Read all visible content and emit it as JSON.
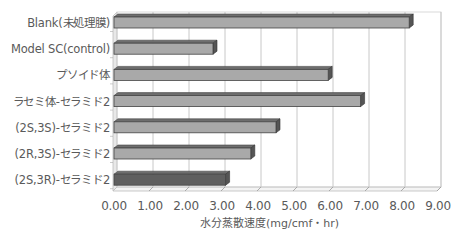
{
  "chart_data": {
    "type": "bar",
    "orientation": "horizontal",
    "style": "3d",
    "title": "",
    "xlabel": "水分蒸散速度(mg/cmf・hr)",
    "ylabel": "",
    "categories": [
      "Blank(未処理膜)",
      "Model SC(control)",
      "プソイド体",
      "ラセミ体-セラミド2",
      "(2S,3S)-セラミド2",
      "(2R,3S)-セラミド2",
      "(2S,3R)-セラミド2"
    ],
    "values": [
      8.2,
      2.75,
      5.95,
      6.85,
      4.5,
      3.8,
      3.1
    ],
    "highlight_index": 6,
    "xlim": [
      0,
      9
    ],
    "x_ticks": [
      "0.00",
      "1.00",
      "2.00",
      "3.00",
      "4.00",
      "5.00",
      "6.00",
      "7.00",
      "8.00",
      "9.00"
    ],
    "grid": true,
    "legend": null,
    "colors": {
      "bar": "#a9a9a9",
      "bar_top": "#6e6e6e",
      "bar_side": "#555555",
      "highlight_bar": "#5f5f5f",
      "grid": "#c8c8c8",
      "wall": "#e8e8e8"
    }
  }
}
